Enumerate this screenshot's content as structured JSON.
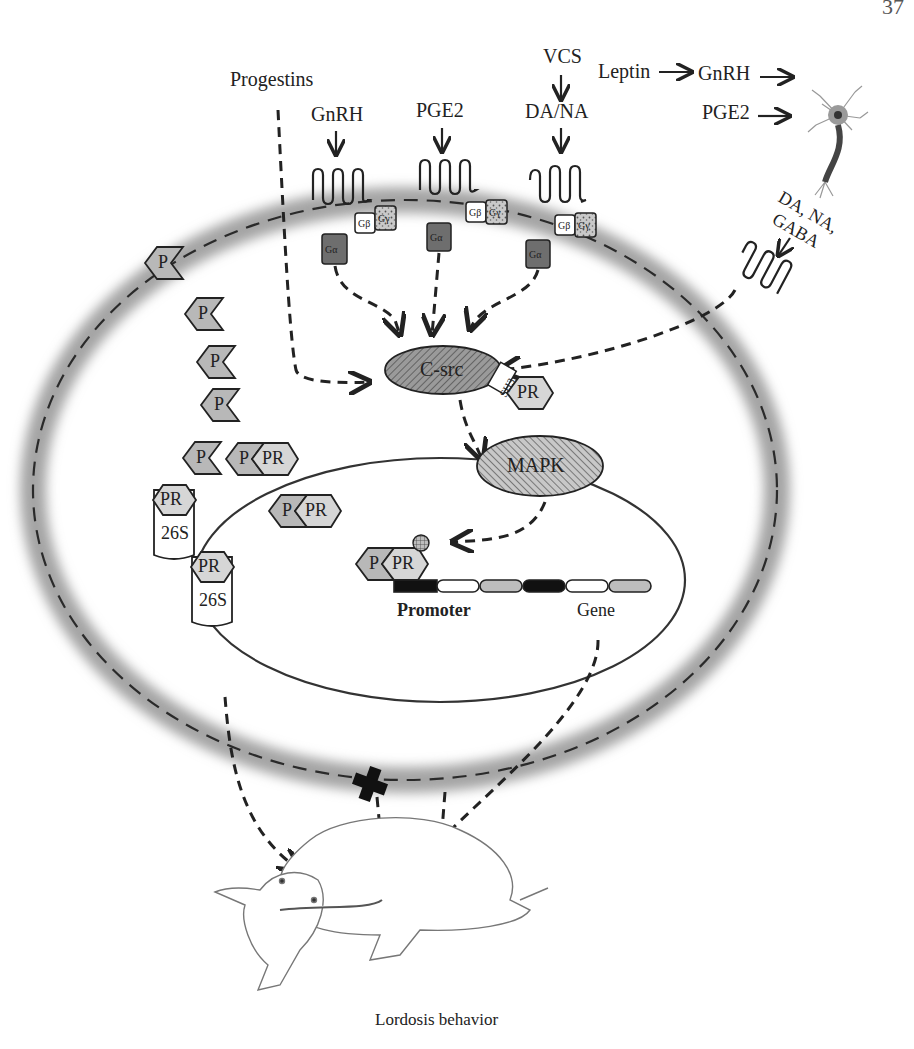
{
  "page": {
    "page_number_fragment": "37"
  },
  "inputs": {
    "progestins": "Progestins",
    "gnrh_receptor_ligand": "GnRH",
    "pge2_receptor_ligand": "PGE2",
    "vcs": "VCS",
    "da_na": "DA/NA",
    "leptin": "Leptin",
    "gnrh_neuron_input": "GnRH",
    "pge2_neuron_input": "PGE2",
    "da_na_gaba": [
      "DA, NA,",
      "GABA"
    ]
  },
  "membrane": {
    "receptors": [
      {
        "id": "gnrh-receptor",
        "ligand": "GnRH"
      },
      {
        "id": "pge2-receptor",
        "ligand": "PGE2"
      },
      {
        "id": "dana-receptor",
        "ligand": "DA/NA"
      },
      {
        "id": "dana-gaba-receptor",
        "ligand": "DA, NA, GABA"
      }
    ],
    "g_protein": {
      "alpha": "Gα",
      "beta": "Gβ",
      "gamma": "Gγ"
    }
  },
  "cytoplasm": {
    "ligand_label": "P",
    "receptor_label": "PR",
    "proteasome_label": "26S",
    "csrc_label": "C-src",
    "sh3_label": "SH3",
    "mapk_label": "MAPK",
    "phospho_label": "P"
  },
  "nucleus": {
    "promoter_label": "Promoter",
    "gene_label": "Gene"
  },
  "outcome": {
    "behavior_label": "Lordosis behavior",
    "blocked_marker": "cross-icon"
  },
  "colors": {
    "membrane": "#a8a8a8",
    "ligand_fill": "#b8b8b8",
    "receptor_fill": "#d6d6d6",
    "g_alpha_fill": "#6e6e6e",
    "stroke": "#222222"
  }
}
